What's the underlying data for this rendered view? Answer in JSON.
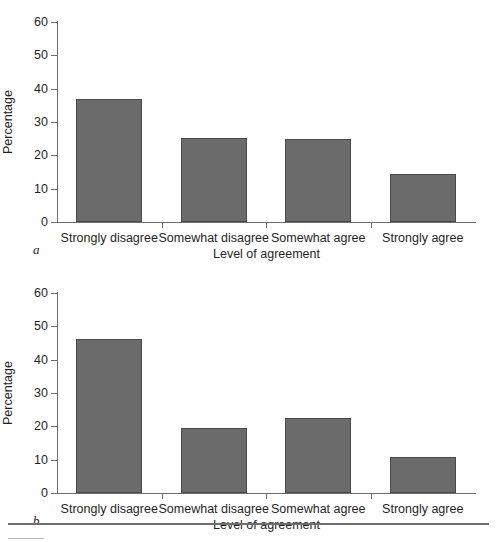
{
  "figure": {
    "background_color": "#ffffff",
    "bar_color": "#6b6b6b",
    "axis_color": "#6e6e6e",
    "text_color": "#1f1f1f"
  },
  "panels": [
    {
      "letter": "a",
      "ylabel": "Percentage",
      "xlabel": "Level of agreement",
      "yticks": [
        "60",
        "50",
        "40",
        "30",
        "20",
        "10",
        "0"
      ],
      "categories": [
        "Strongly disagree",
        "Somewhat disagree",
        "Somewhat agree",
        "Strongly agree"
      ]
    },
    {
      "letter": "b",
      "ylabel": "Percentage",
      "xlabel": "Level of agreement",
      "yticks": [
        "60",
        "50",
        "40",
        "30",
        "20",
        "10",
        "0"
      ],
      "categories": [
        "Strongly disagree",
        "Somewhat disagree",
        "Somewhat agree",
        "Strongly agree"
      ]
    }
  ],
  "chart_data": [
    {
      "type": "bar",
      "panel": "a",
      "title": "",
      "categories": [
        "Strongly disagree",
        "Somewhat disagree",
        "Somewhat agree",
        "Strongly agree"
      ],
      "values": [
        37.0,
        25.2,
        25.0,
        14.4
      ],
      "xlabel": "Level of agreement",
      "ylabel": "Percentage",
      "ylim": [
        0,
        60
      ],
      "ytick_values": [
        0,
        10,
        20,
        30,
        40,
        50,
        60
      ],
      "grid": false,
      "legend": false,
      "bar_color": "#6b6b6b"
    },
    {
      "type": "bar",
      "panel": "b",
      "title": "",
      "categories": [
        "Strongly disagree",
        "Somewhat disagree",
        "Somewhat agree",
        "Strongly agree"
      ],
      "values": [
        46.2,
        19.6,
        22.5,
        10.8
      ],
      "xlabel": "Level of agreement",
      "ylabel": "Percentage",
      "ylim": [
        0,
        60
      ],
      "ytick_values": [
        0,
        10,
        20,
        30,
        40,
        50,
        60
      ],
      "grid": false,
      "legend": false,
      "bar_color": "#6b6b6b"
    }
  ]
}
